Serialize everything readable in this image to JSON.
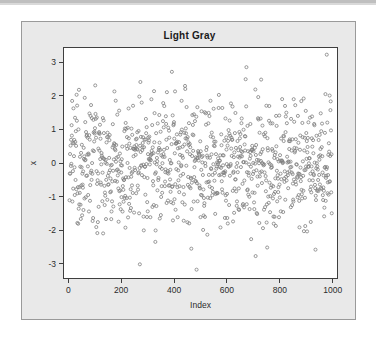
{
  "figure": {
    "title": "Light Gray",
    "panel_bg_color": "#e9e9e9",
    "plot_bg_color": "#ffffff",
    "frame_color": "#9a9a9a",
    "axis_color": "#3f3f3f",
    "point_color": "#808080"
  },
  "chart_data": {
    "type": "scatter",
    "title": "Light Gray",
    "xlabel": "Index",
    "ylabel": "x",
    "grid": false,
    "legend": null,
    "xlim": [
      -20,
      1020
    ],
    "ylim": [
      -3.45,
      3.45
    ],
    "xticks": [
      0,
      200,
      400,
      600,
      800,
      1000
    ],
    "xtick_labels": [
      "0",
      "200",
      "400",
      "600",
      "800",
      "1000"
    ],
    "yticks": [
      3,
      2,
      1,
      0,
      -1,
      -2,
      -3
    ],
    "ytick_labels": [
      "3",
      "2",
      "1",
      "0",
      "-1",
      "-2",
      "-3"
    ],
    "n_points": 1000,
    "marker": "open-circle",
    "marker_size_px": 3.1,
    "series": [
      {
        "name": "x",
        "description": "1000 standard-normal random values plotted against their index",
        "x_range": [
          1,
          1000
        ],
        "y_mean": 0.0,
        "y_sd": 1.0,
        "y_min": -3.2,
        "y_max": 3.25
      }
    ]
  },
  "axis_annotations": {
    "x_axis_name": "Index",
    "y_axis_name": "x"
  }
}
